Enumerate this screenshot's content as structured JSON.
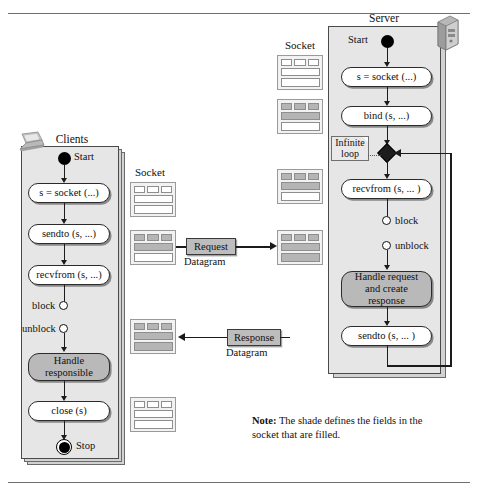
{
  "figure": {
    "type": "uml-activity-diagram"
  },
  "client": {
    "title": "Clients",
    "device_icon": "laptop-icon",
    "start_label": "Start",
    "stop_label": "Stop",
    "steps": [
      {
        "label": "s = socket (...)",
        "shaded": false
      },
      {
        "label": "sendto (s, ...)",
        "shaded": false
      },
      {
        "label": "recvfrom (s, ...)",
        "shaded": false
      },
      {
        "label": "Handle\nresponsible",
        "shaded": true
      },
      {
        "label": "close (s)",
        "shaded": false
      }
    ],
    "block_label": "block",
    "unblock_label": "unblock"
  },
  "server": {
    "title": "Server",
    "device_icon": "server-tower-icon",
    "start_label": "Start",
    "steps": [
      {
        "label": "s = socket (...)",
        "shaded": false
      },
      {
        "label": "bind (s, ...)",
        "shaded": false
      },
      {
        "label": "recvfrom (s, ... )",
        "shaded": false
      },
      {
        "label": "Handle request\nand create\nresponse",
        "shaded": true
      },
      {
        "label": "sendto (s, ... )",
        "shaded": false
      }
    ],
    "loop_note": "Infinite\nloop",
    "block_label": "block",
    "unblock_label": "unblock"
  },
  "sockets": {
    "client_column_label": "Socket",
    "server_column_label": "Socket",
    "client_boxes": [
      {
        "name": "client-socket-created",
        "cells": [
          false,
          false,
          false
        ],
        "bars": [
          false,
          false
        ]
      },
      {
        "name": "client-socket-request-filled",
        "cells": [
          true,
          true,
          true
        ],
        "bars": [
          true,
          false
        ]
      },
      {
        "name": "client-socket-response-filled",
        "cells": [
          true,
          true,
          true
        ],
        "bars": [
          true,
          true
        ]
      },
      {
        "name": "client-socket-closed",
        "cells": [
          false,
          false,
          false
        ],
        "bars": [
          false,
          false
        ]
      }
    ],
    "server_boxes": [
      {
        "name": "server-socket-created",
        "cells": [
          false,
          false,
          false
        ],
        "bars": [
          false,
          false
        ]
      },
      {
        "name": "server-socket-bound",
        "cells": [
          true,
          true,
          true
        ],
        "bars": [
          true,
          false
        ]
      },
      {
        "name": "server-socket-listening",
        "cells": [
          true,
          true,
          true
        ],
        "bars": [
          true,
          false
        ]
      },
      {
        "name": "server-socket-request-received",
        "cells": [
          true,
          true,
          true
        ],
        "bars": [
          true,
          true
        ]
      }
    ]
  },
  "datagrams": {
    "request": {
      "label": "Request",
      "sub": "Datagram",
      "direction": "client-to-server"
    },
    "response": {
      "label": "Response",
      "sub": "Datagram",
      "direction": "server-to-client"
    }
  },
  "note": {
    "prefix": "Note:",
    "text": " The shade defines the fields in the socket that are filled."
  },
  "colors": {
    "panel_fill": "#e6e6e6",
    "node_fill": "#ffffff",
    "node_shaded_fill": "#b9b9b9",
    "socket_fill": "#b5b5b5",
    "datagram_fill": "#bdbdbd",
    "stroke": "#2b2b2b"
  }
}
